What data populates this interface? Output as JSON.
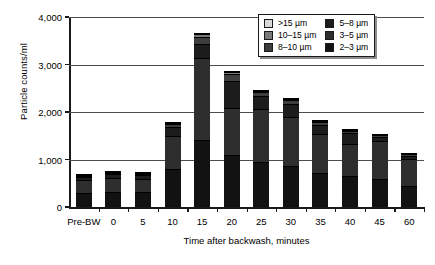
{
  "chart_data": {
    "type": "bar",
    "stacked": true,
    "title": "",
    "xlabel": "Time after backwash, minutes",
    "ylabel": "Particle counts/ml",
    "categories": [
      "Pre-BW",
      "0",
      "5",
      "10",
      "15",
      "20",
      "25",
      "30",
      "35",
      "40",
      "45",
      "60"
    ],
    "ylim": [
      0,
      4000
    ],
    "yticks": [
      0,
      1000,
      2000,
      3000,
      4000
    ],
    "ytick_labels": [
      "0",
      "1,000",
      "2,000",
      "3,000",
      "4,000"
    ],
    "grid": true,
    "legend_position": "top-right",
    "series": [
      {
        "name": "2–3 µm",
        "color": "#121212",
        "values": [
          300,
          320,
          320,
          810,
          1420,
          1090,
          950,
          870,
          710,
          660,
          580,
          450
        ]
      },
      {
        "name": "3–5 µm",
        "color": "#2e2e2e",
        "values": [
          270,
          290,
          270,
          680,
          1710,
          990,
          1120,
          1030,
          820,
          660,
          800,
          560
        ]
      },
      {
        "name": "5–8 µm",
        "color": "#1c1c1c",
        "values": [
          60,
          75,
          75,
          190,
          310,
          580,
          260,
          270,
          200,
          230,
          100,
          70
        ]
      },
      {
        "name": "8–10 µm",
        "color": "#3d3d3d",
        "values": [
          30,
          30,
          30,
          70,
          140,
          140,
          90,
          80,
          60,
          50,
          30,
          30
        ]
      },
      {
        "name": "10–15 µm",
        "color": "#7a7a7a",
        "values": [
          10,
          10,
          10,
          25,
          60,
          50,
          30,
          20,
          20,
          20,
          10,
          10
        ]
      },
      {
        "name": ">15 µm",
        "color": "#d9d9d9",
        "values": [
          5,
          5,
          5,
          15,
          30,
          20,
          10,
          10,
          10,
          10,
          0,
          0
        ]
      }
    ],
    "totals": [
      675,
      730,
      710,
      1790,
      3670,
      2870,
      2460,
      2280,
      1820,
      1630,
      1520,
      1120
    ]
  },
  "legend": {
    "items": [
      {
        "label": ">15 µm",
        "color": "#d9d9d9"
      },
      {
        "label": "5–8 µm",
        "color": "#1c1c1c"
      },
      {
        "label": "10–15 µm",
        "color": "#7a7a7a"
      },
      {
        "label": "3–5 µm",
        "color": "#2e2e2e"
      },
      {
        "label": "8–10 µm",
        "color": "#3d3d3d"
      },
      {
        "label": "2–3 µm",
        "color": "#121212"
      }
    ]
  }
}
